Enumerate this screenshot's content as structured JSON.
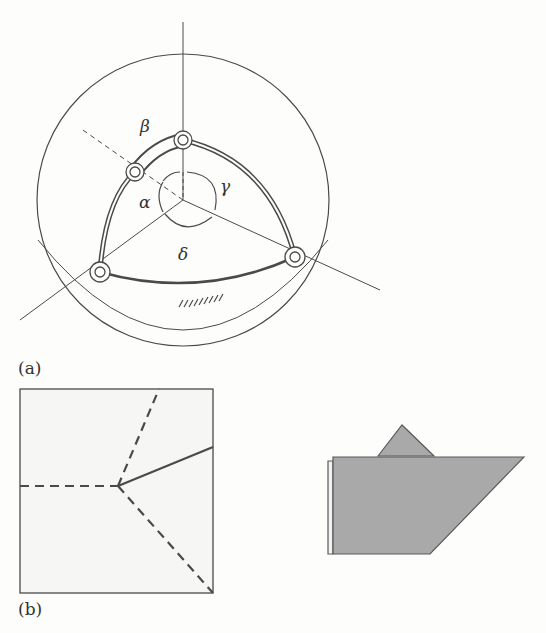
{
  "figure": {
    "panel_a": {
      "label": "(a)",
      "angle_labels": {
        "alpha": "α",
        "beta": "β",
        "gamma": "γ",
        "delta": "δ"
      }
    },
    "panel_b": {
      "label": "(b)"
    }
  },
  "colors": {
    "line": "#4a4a4a",
    "background": "#fdfdfc",
    "fold_fill": "#a9a9a9",
    "sheet_fill": "#f6f6f5"
  }
}
